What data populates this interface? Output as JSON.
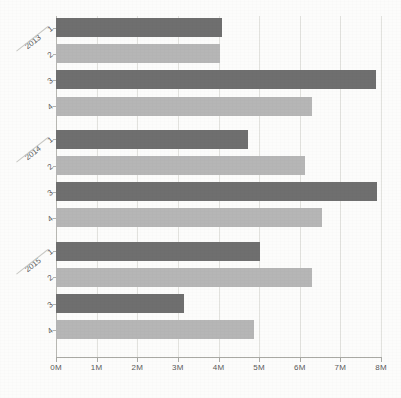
{
  "chart_data": {
    "type": "bar",
    "orientation": "horizontal",
    "title": "",
    "subtitle": "",
    "xlabel": "",
    "ylabel": "",
    "xlim": [
      0,
      8
    ],
    "grid": true,
    "legend": "none",
    "units": "millions",
    "xtick_labels": [
      "0M",
      "1M",
      "2M",
      "3M",
      "4M",
      "5M",
      "6M",
      "7M",
      "8M"
    ],
    "xtick_values": [
      0,
      1,
      2,
      3,
      4,
      5,
      6,
      7,
      8
    ],
    "groups": [
      "2013",
      "2014",
      "2015"
    ],
    "categories": [
      "2013 1",
      "2013 2",
      "2013 3",
      "2013 4",
      "2014 1",
      "2014 2",
      "2014 3",
      "2014 4",
      "2015 1",
      "2015 2",
      "2015 3",
      "2015 4"
    ],
    "quarter_labels": [
      "1",
      "2",
      "3",
      "4",
      "1",
      "2",
      "3",
      "4",
      "1",
      "2",
      "3",
      "4"
    ],
    "values": [
      4.09,
      4.04,
      7.88,
      6.3,
      4.73,
      6.13,
      7.9,
      6.55,
      5.02,
      6.3,
      3.15,
      4.88
    ],
    "bar_shades": [
      "dark",
      "light",
      "dark",
      "light",
      "dark",
      "light",
      "dark",
      "light",
      "dark",
      "light",
      "dark",
      "light"
    ],
    "colors": {
      "dark": "#6f6f6f",
      "light": "#b6b6b6",
      "gridline": "#e2e2de",
      "axis": "#a9a9a4",
      "text": "#5c5c5d",
      "background": "#fcfcfb"
    }
  },
  "axis": {
    "year_labels": [
      "2013",
      "2014",
      "2015"
    ],
    "x_ticks": [
      "0M",
      "1M",
      "2M",
      "3M",
      "4M",
      "5M",
      "6M",
      "7M",
      "8M"
    ]
  },
  "bars": [
    {
      "category": "2013 1",
      "quarter": "1",
      "year": "2013",
      "value": 4.09,
      "shade": "dark"
    },
    {
      "category": "2013 2",
      "quarter": "2",
      "year": "2013",
      "value": 4.04,
      "shade": "light"
    },
    {
      "category": "2013 3",
      "quarter": "3",
      "year": "2013",
      "value": 7.88,
      "shade": "dark"
    },
    {
      "category": "2013 4",
      "quarter": "4",
      "year": "2013",
      "value": 6.3,
      "shade": "light"
    },
    {
      "category": "2014 1",
      "quarter": "1",
      "year": "2014",
      "value": 4.73,
      "shade": "dark"
    },
    {
      "category": "2014 2",
      "quarter": "2",
      "year": "2014",
      "value": 6.13,
      "shade": "light"
    },
    {
      "category": "2014 3",
      "quarter": "3",
      "year": "2014",
      "value": 7.9,
      "shade": "dark"
    },
    {
      "category": "2014 4",
      "quarter": "4",
      "year": "2014",
      "value": 6.55,
      "shade": "light"
    },
    {
      "category": "2015 1",
      "quarter": "1",
      "year": "2015",
      "value": 5.02,
      "shade": "dark"
    },
    {
      "category": "2015 2",
      "quarter": "2",
      "year": "2015",
      "value": 6.3,
      "shade": "light"
    },
    {
      "category": "2015 3",
      "quarter": "3",
      "year": "2015",
      "value": 3.15,
      "shade": "dark"
    },
    {
      "category": "2015 4",
      "quarter": "4",
      "year": "2015",
      "value": 4.88,
      "shade": "light"
    }
  ]
}
